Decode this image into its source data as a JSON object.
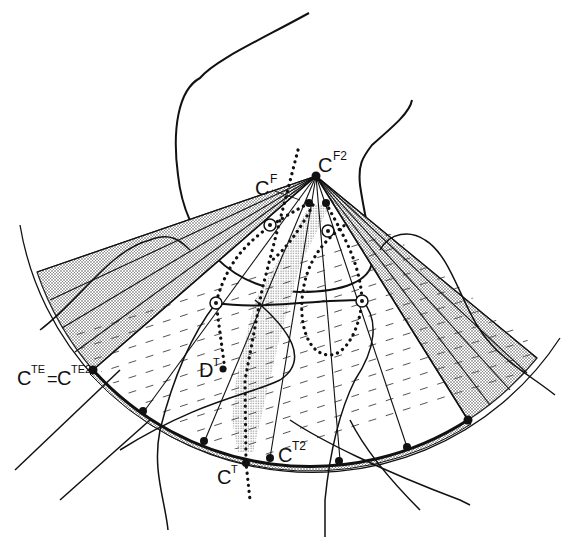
{
  "figure": {
    "type": "anatomical-geometric-diagram",
    "colors": {
      "ink": "#111111",
      "stipple": "#555555",
      "background": "#ffffff"
    },
    "labels": {
      "cf": {
        "base": "C",
        "sup": "F"
      },
      "cf2": {
        "base": "C",
        "sup": "F2"
      },
      "cte": {
        "base": "C",
        "sup": "TE"
      },
      "equals": "=",
      "cte2": {
        "base": "C",
        "sup": "TE2"
      },
      "dt": {
        "base": "D",
        "sup": "T"
      },
      "ct": {
        "base": "C",
        "sup": "T"
      },
      "ct2": {
        "base": "C",
        "sup": "T2"
      }
    }
  }
}
